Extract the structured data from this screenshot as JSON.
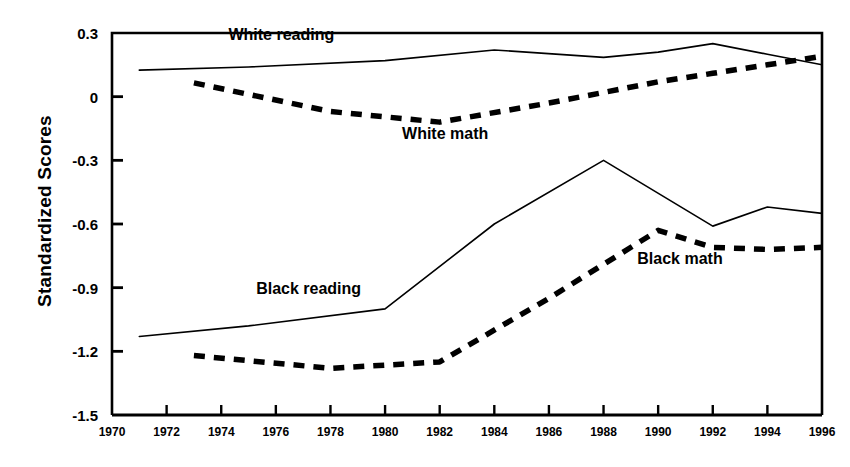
{
  "chart_data": {
    "type": "line",
    "title": "",
    "xlabel": "",
    "ylabel": "Standardized Scores",
    "xlim": [
      1970,
      1996
    ],
    "ylim": [
      -1.5,
      0.3
    ],
    "grid": false,
    "legend_position": "inline-annotations",
    "x_ticks": [
      "1970",
      "1972",
      "1974",
      "1976",
      "1978",
      "1980",
      "1982",
      "1984",
      "1986",
      "1988",
      "1990",
      "1992",
      "1994",
      "1996"
    ],
    "y_ticks": [
      "0.3",
      "0",
      "-0.3",
      "-0.6",
      "-0.9",
      "-1.2",
      "-1.5"
    ],
    "y_tick_values": [
      0.3,
      0,
      -0.3,
      -0.6,
      -0.9,
      -1.2,
      -1.5
    ],
    "series": [
      {
        "name": "White reading",
        "style": "solid",
        "color": "#000000",
        "x": [
          1971,
          1975,
          1980,
          1984,
          1988,
          1990,
          1992,
          1994,
          1996
        ],
        "values": [
          0.125,
          0.14,
          0.17,
          0.22,
          0.185,
          0.21,
          0.25,
          0.2,
          0.15
        ]
      },
      {
        "name": "White math",
        "style": "dashed",
        "color": "#000000",
        "x": [
          1973,
          1978,
          1982,
          1986,
          1990,
          1992,
          1994,
          1996
        ],
        "values": [
          0.065,
          -0.07,
          -0.12,
          -0.03,
          0.07,
          0.11,
          0.15,
          0.19
        ]
      },
      {
        "name": "Black reading",
        "style": "solid",
        "color": "#000000",
        "x": [
          1971,
          1975,
          1980,
          1984,
          1988,
          1992,
          1994,
          1996
        ],
        "values": [
          -1.13,
          -1.08,
          -1.0,
          -0.6,
          -0.3,
          -0.61,
          -0.52,
          -0.55
        ]
      },
      {
        "name": "Black math",
        "style": "dashed",
        "color": "#000000",
        "x": [
          1973,
          1978,
          1982,
          1986,
          1990,
          1992,
          1994,
          1996
        ],
        "values": [
          -1.22,
          -1.28,
          -1.25,
          -0.95,
          -0.63,
          -0.71,
          -0.72,
          -0.71
        ]
      }
    ],
    "annotations": [
      {
        "text": "White reading",
        "x": 1976.2,
        "y": 0.265
      },
      {
        "text": "White math",
        "x": 1982.2,
        "y": -0.2
      },
      {
        "text": "Black reading",
        "x": 1977.2,
        "y": -0.93
      },
      {
        "text": "Black math",
        "x": 1990.8,
        "y": -0.79
      }
    ]
  }
}
